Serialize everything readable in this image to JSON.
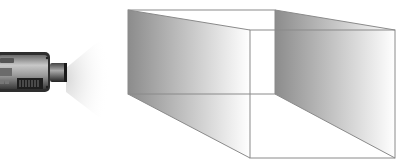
{
  "diagram": {
    "camera": {
      "icon": "video-camera-icon",
      "body_color": "#3a3a3a",
      "lens_color": "#2a2a2a",
      "light_cone_color": "#dcdcdc"
    },
    "frustum": {
      "far_plane": {
        "x1": 128,
        "y1": 10,
        "x2": 275,
        "y2": 94
      },
      "near_plane": {
        "x1": 250,
        "y1": 30,
        "x2": 395,
        "y2": 158
      },
      "edge_color": "#8a8a8a",
      "shade_dark": "#8c8c8c",
      "shade_light": "#ffffff"
    }
  }
}
